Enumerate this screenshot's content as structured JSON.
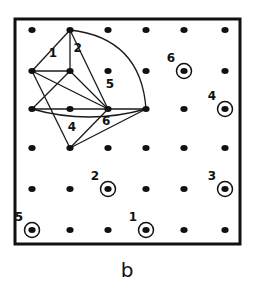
{
  "figure": {
    "panel_label": "b",
    "grid": {
      "rows": 6,
      "cols": 6
    },
    "diagram": {
      "nodes": [
        {
          "id": "n_top",
          "row": 0,
          "col": 1
        },
        {
          "id": "n_l1",
          "row": 1,
          "col": 0
        },
        {
          "id": "n_c1",
          "row": 1,
          "col": 1
        },
        {
          "id": "n_l2",
          "row": 2,
          "col": 0
        },
        {
          "id": "n_c2",
          "row": 2,
          "col": 1
        },
        {
          "id": "n_hub",
          "row": 2,
          "col": 2
        },
        {
          "id": "n_r2",
          "row": 2,
          "col": 3
        },
        {
          "id": "n_bot",
          "row": 3,
          "col": 1
        }
      ],
      "edges": [
        {
          "from": "n_top",
          "to": "n_l1",
          "kind": "line"
        },
        {
          "from": "n_top",
          "to": "n_c1",
          "kind": "line"
        },
        {
          "from": "n_top",
          "to": "n_hub",
          "kind": "line"
        },
        {
          "from": "n_top",
          "to": "n_r2",
          "kind": "arc"
        },
        {
          "from": "n_l1",
          "to": "n_c1",
          "kind": "line"
        },
        {
          "from": "n_l1",
          "to": "n_hub",
          "kind": "line"
        },
        {
          "from": "n_l1",
          "to": "n_bot",
          "kind": "line"
        },
        {
          "from": "n_c1",
          "to": "n_l2",
          "kind": "line"
        },
        {
          "from": "n_c1",
          "to": "n_hub",
          "kind": "line"
        },
        {
          "from": "n_l2",
          "to": "n_r2",
          "kind": "line"
        },
        {
          "from": "n_l2",
          "to": "n_r2",
          "kind": "lower-arc"
        },
        {
          "from": "n_bot",
          "to": "n_hub",
          "kind": "line"
        },
        {
          "from": "n_bot",
          "to": "n_r2",
          "kind": "line"
        }
      ],
      "region_labels": [
        {
          "text": "1",
          "row": 0.55,
          "col": 0.55
        },
        {
          "text": "2",
          "row": 0.45,
          "col": 1.2
        },
        {
          "text": "5",
          "row": 1.35,
          "col": 2.05
        },
        {
          "text": "4",
          "row": 2.45,
          "col": 1.05
        },
        {
          "text": "6",
          "row": 2.3,
          "col": 1.95
        }
      ]
    },
    "circled_points": [
      {
        "label": "6",
        "row": 1,
        "col": 4
      },
      {
        "label": "4",
        "row": 2,
        "col": 5
      },
      {
        "label": "2",
        "row": 4,
        "col": 2
      },
      {
        "label": "3",
        "row": 4,
        "col": 5
      },
      {
        "label": "5",
        "row": 5,
        "col": 0
      },
      {
        "label": "1",
        "row": 5,
        "col": 3
      }
    ]
  }
}
